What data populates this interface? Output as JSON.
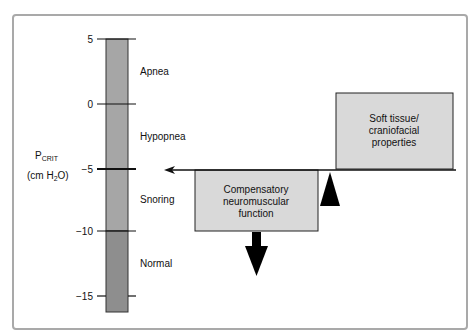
{
  "diagram": {
    "axis": {
      "label_main": "P",
      "label_sub": "CRIT",
      "unit_prefix": "(cm H",
      "unit_sub": "2",
      "unit_suffix": "O)",
      "ticks": [
        "5",
        "0",
        "−5",
        "−10",
        "−15"
      ],
      "tick_values": [
        5,
        0,
        -5,
        -10,
        -15
      ]
    },
    "zones": [
      {
        "label": "Apnea",
        "range": [
          0,
          5
        ]
      },
      {
        "label": "Hypopnea",
        "range": [
          -5,
          0
        ]
      },
      {
        "label": "Snoring",
        "range": [
          -10,
          -5
        ]
      },
      {
        "label": "Normal",
        "range": [
          -16,
          -10
        ]
      }
    ],
    "boxes": {
      "soft_tissue": [
        "Soft tissue/",
        "craniofacial",
        "properties"
      ],
      "compensatory": [
        "Compensatory",
        "neuromuscular",
        "function"
      ]
    },
    "colors": {
      "bar_upper": "#a6a6a6",
      "bar_lower": "#8e8e8e",
      "box_fill": "#d9d9d9",
      "frame": "#a9a9a9"
    }
  }
}
